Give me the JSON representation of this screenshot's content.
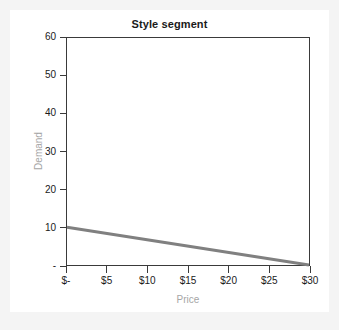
{
  "card": {
    "background": "#ffffff",
    "page_background": "#f4f4f4"
  },
  "chart_data": {
    "type": "line",
    "title": "Style segment",
    "xlabel": "Price",
    "ylabel": "Demand",
    "xlim": [
      0,
      30
    ],
    "ylim": [
      0,
      60
    ],
    "grid": false,
    "legend": null,
    "x_tick_values": [
      0,
      5,
      10,
      15,
      20,
      25,
      30
    ],
    "x_tick_labels": [
      "$-",
      "$5",
      "$10",
      "$15",
      "$20",
      "$25",
      "$30"
    ],
    "y_tick_values": [
      0,
      10,
      20,
      30,
      40,
      50,
      60
    ],
    "y_tick_labels": [
      "-",
      "10",
      "20",
      "30",
      "40",
      "50",
      "60"
    ],
    "series": [
      {
        "name": "Demand curve",
        "color": "#808080",
        "line_width": 3,
        "x": [
          0,
          30
        ],
        "values": [
          10,
          0
        ]
      }
    ],
    "annotations": []
  },
  "style": {
    "title_color": "#1a1a1a",
    "tick_color": "#1a1a1a",
    "axis_label_color": "#a6a6a6",
    "axis_line_color": "#3a3a3a",
    "series_color": "#808080"
  }
}
